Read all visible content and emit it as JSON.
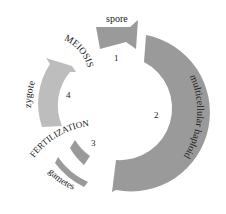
{
  "diagram": {
    "type": "life-cycle",
    "colors": {
      "dark_segment": "#9a9a9a",
      "light_segment": "#bdbdbd",
      "text": "#1a1a1a",
      "background": "#ffffff"
    },
    "stages": [
      {
        "number": "1",
        "label": "spore"
      },
      {
        "number": "2",
        "label": "multicellular haploid"
      },
      {
        "number": "3",
        "label": "gametes"
      },
      {
        "number": "4",
        "label": "zygote"
      }
    ],
    "processes": [
      {
        "label": "MEIOSIS"
      },
      {
        "label": "FERTILIZATION"
      }
    ]
  }
}
